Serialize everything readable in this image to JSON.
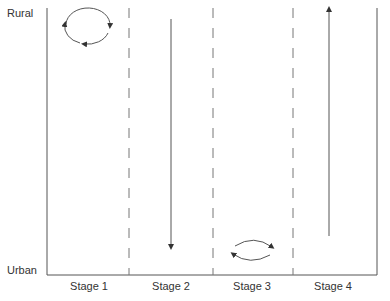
{
  "diagram": {
    "y_axis": {
      "top_label": "Rural",
      "bottom_label": "Urban"
    },
    "stages": [
      {
        "label": "Stage 1",
        "movement": "circular cycle near rural"
      },
      {
        "label": "Stage 2",
        "movement": "downward arrow rural to urban"
      },
      {
        "label": "Stage 3",
        "movement": "two-way circulation near urban"
      },
      {
        "label": "Stage 4",
        "movement": "upward arrow urban to rural"
      }
    ],
    "colors": {
      "line": "#555555",
      "dash": "#777777",
      "text": "#333333"
    }
  }
}
